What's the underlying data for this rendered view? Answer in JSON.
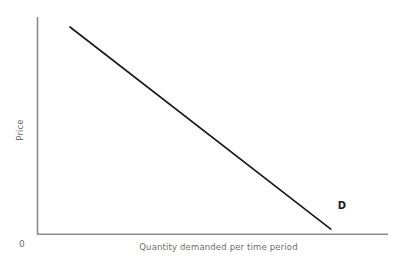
{
  "figure": {
    "background_color": "#ffffff",
    "axis_color": "#8a8a8a",
    "curve_color": "#1c1c1c",
    "label_color": "#6e6e6e",
    "origin_label": "0",
    "curve_label": "D",
    "y_axis_label": "Price",
    "x_axis_label": "Quantity demanded per time period"
  },
  "chart_data": {
    "type": "line",
    "title": "",
    "subtitle": "",
    "xlabel": "Quantity demanded per time period",
    "ylabel": "Price",
    "xlim": [
      0,
      100
    ],
    "ylim": [
      0,
      100
    ],
    "grid": false,
    "legend": "none",
    "x_tick_labels": [],
    "y_tick_labels": [],
    "origin_label": "0",
    "annotations": [
      {
        "text": "D",
        "x": 86,
        "y": 5,
        "bold": true
      }
    ],
    "series": [
      {
        "name": "D",
        "label": "D",
        "color": "#1c1c1c",
        "x": [
          9.4,
          83.7
        ],
        "values": [
          95.4,
          2.3
        ],
        "description": "Downward-sloping linear demand curve"
      }
    ]
  }
}
